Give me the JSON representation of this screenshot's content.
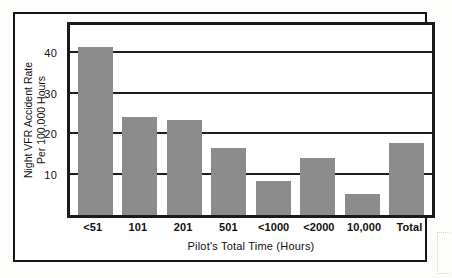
{
  "chart_data": {
    "type": "bar",
    "title": "",
    "xlabel": "Pilot's Total Time (Hours)",
    "ylabel_line1": "Night VFR Accident Rate",
    "ylabel_line2": "Per 100,000 Hours",
    "categories": [
      "<51",
      "101",
      "201",
      "501",
      "<1000",
      "<2000",
      "10,000",
      "Total"
    ],
    "values": [
      41.5,
      24.2,
      23.4,
      16.5,
      8.3,
      14.0,
      5.3,
      17.7
    ],
    "ylim": [
      0,
      47
    ],
    "yticks": [
      10,
      20,
      30,
      40
    ],
    "ytick_labels": [
      "10",
      "20",
      "30",
      "40"
    ],
    "grid": true,
    "legend": null,
    "bar_color": "#8c8c8c",
    "axis_color": "#1a1a1a",
    "background_color": "#ffffff"
  }
}
